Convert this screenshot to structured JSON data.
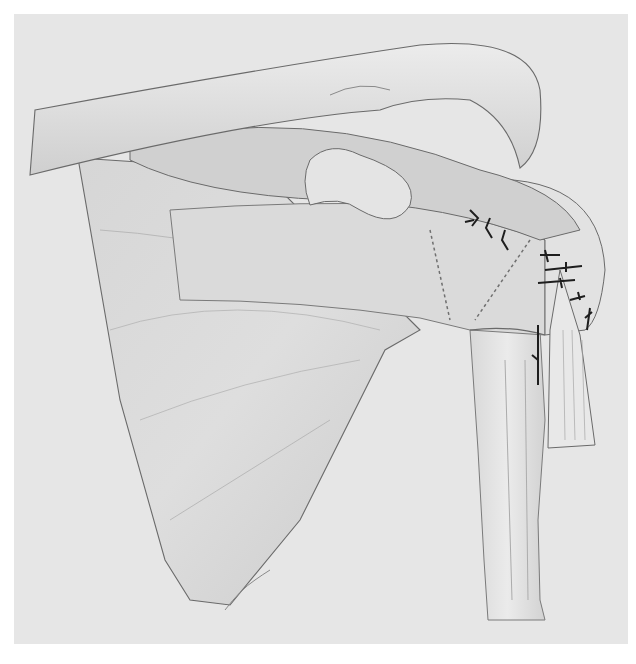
{
  "illustration": {
    "subject": "shoulder anatomy with sutured rotator cuff repair",
    "style": "grayscale pencil medical illustration",
    "colors": {
      "background": "#e6e6e6",
      "bone_fill": "#dedede",
      "muscle_fill": "#d4d4d4",
      "outline": "#6a6a6a",
      "suture": "#1e1e1e"
    },
    "structures": [
      "clavicle",
      "acromion",
      "coracoid-process",
      "scapula",
      "supraspinatus",
      "infraspinatus",
      "humerus",
      "biceps-tendon",
      "sutures"
    ]
  }
}
